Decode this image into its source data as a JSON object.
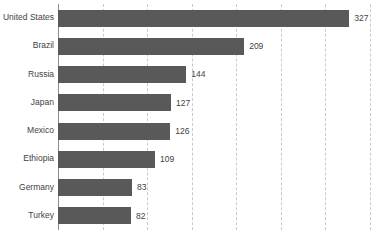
{
  "chart_data": {
    "type": "bar",
    "orientation": "horizontal",
    "title": "",
    "subtitle": "",
    "xlabel": "",
    "ylabel": "",
    "categories": [
      "United States",
      "Brazil",
      "Russia",
      "Japan",
      "Mexico",
      "Ethiopia",
      "Germany",
      "Turkey"
    ],
    "values": [
      327,
      209,
      144,
      127,
      126,
      109,
      83,
      82
    ],
    "value_labels": [
      "327",
      "209",
      "144",
      "127",
      "126",
      "109",
      "83",
      "82"
    ],
    "series": [
      {
        "name": "",
        "values": [
          327,
          209,
          144,
          127,
          126,
          109,
          83,
          82
        ]
      }
    ],
    "xlim": [
      0,
      366
    ],
    "grid": true,
    "grid_axis": "x",
    "grid_style": "dashed",
    "gridline_values": [
      50,
      100,
      150,
      200,
      250,
      300,
      350
    ],
    "tick_labels_visible": false,
    "legend": false,
    "legend_position": "none",
    "colors": {
      "bar": "#595959",
      "gridline": "#c9c9c9",
      "axis": "#8c8c8c",
      "label_text": "#3f3f3f",
      "background": "#ffffff"
    }
  }
}
